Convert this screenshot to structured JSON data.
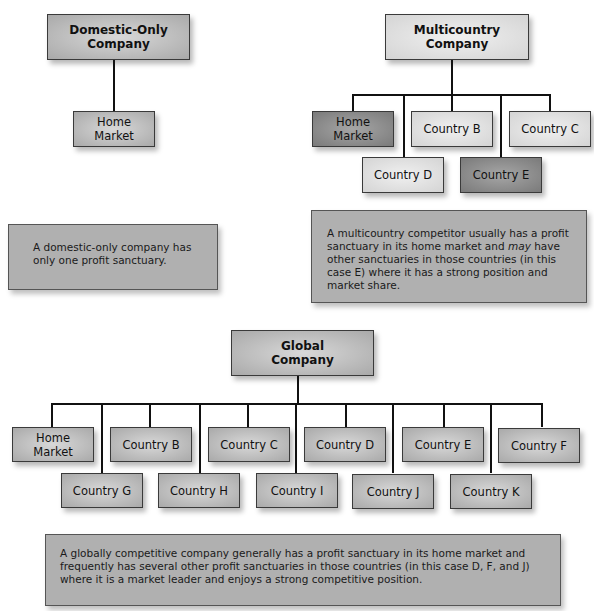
{
  "domestic": {
    "title": "Domestic-Only Company",
    "nodes": [
      {
        "label": "Home Market",
        "shade": "mid"
      }
    ],
    "description": "A domestic-only company has only one profit sanctuary."
  },
  "multicountry": {
    "title": "Multicountry Company",
    "nodes": [
      {
        "label": "Home Market",
        "shade": "dark"
      },
      {
        "label": "Country B",
        "shade": "light"
      },
      {
        "label": "Country C",
        "shade": "light"
      },
      {
        "label": "Country D",
        "shade": "light"
      },
      {
        "label": "Country E",
        "shade": "dark"
      }
    ],
    "description": {
      "part1": "A multicountry competitor usually has a profit sanctuary in its home market and ",
      "emphasis": "may",
      "part2": " have other sanctuaries in those countries (in this case E) where it has a strong position and market share."
    }
  },
  "global": {
    "title": "Global Company",
    "nodes": [
      {
        "label": "Home Market"
      },
      {
        "label": "Country B"
      },
      {
        "label": "Country C"
      },
      {
        "label": "Country D"
      },
      {
        "label": "Country E"
      },
      {
        "label": "Country F"
      },
      {
        "label": "Country G"
      },
      {
        "label": "Country H"
      },
      {
        "label": "Country I"
      },
      {
        "label": "Country J"
      },
      {
        "label": "Country K"
      }
    ],
    "description": "A globally competitive company generally has a profit sanctuary in its home market and frequently has several other profit sanctuaries in those countries (in this case D, F, and J) where it is a market leader and enjoys a strong competitive position."
  },
  "colors": {
    "light_box": "#e2e2e2",
    "mid_box": "#b8b8b8",
    "dark_box": "#8c8c8c",
    "description_box": "#b0b0b0",
    "connector": "#111111"
  }
}
